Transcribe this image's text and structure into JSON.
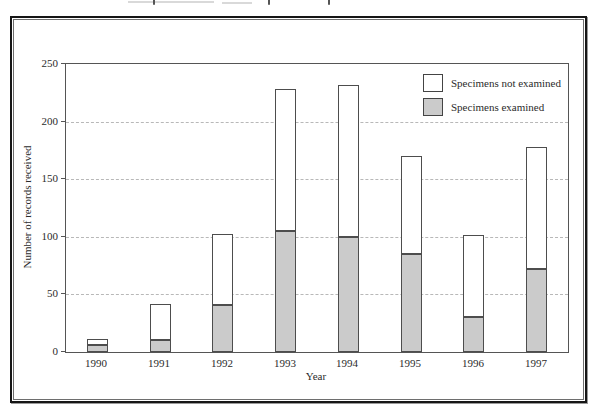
{
  "chart_data": {
    "type": "bar",
    "stacked": true,
    "title": "",
    "xlabel": "Year",
    "ylabel": "Number of records received",
    "categories": [
      "1990",
      "1991",
      "1992",
      "1993",
      "1994",
      "1995",
      "1996",
      "1997"
    ],
    "series": [
      {
        "name": "Specimens examined",
        "fill": "#cbcbcb",
        "values": [
          6,
          10,
          41,
          105,
          100,
          85,
          30,
          72
        ]
      },
      {
        "name": "Specimens not examined",
        "fill": "#ffffff",
        "values": [
          5,
          31,
          62,
          123,
          132,
          85,
          71,
          106
        ]
      }
    ],
    "totals": [
      11,
      41,
      103,
      228,
      232,
      170,
      101,
      178
    ],
    "ylim": [
      0,
      250
    ],
    "yticks": [
      0,
      50,
      100,
      150,
      200,
      250
    ],
    "grid": "horizontal dashed at 50, 100, 150, 200",
    "legend_position": "top-right inside plot",
    "legend": [
      {
        "label": "Specimens not examined",
        "fill": "#ffffff"
      },
      {
        "label": "Specimens examined",
        "fill": "#cbcbcb"
      }
    ]
  },
  "colors": {
    "bar_fill_examined": "#cbcbcb",
    "bar_fill_not_examined": "#ffffff",
    "bar_border": "#4d4d4d",
    "plot_border": "#555555",
    "gridline": "#b8b8b8",
    "frame_outer": "#161616",
    "frame_inner": "#6e6e6e",
    "text": "#2b2b2b"
  }
}
